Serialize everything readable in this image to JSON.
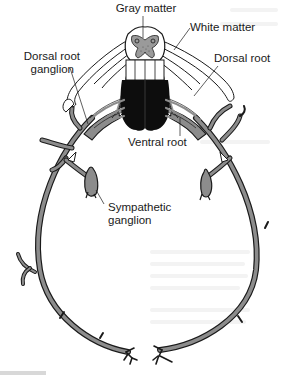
{
  "figure": {
    "type": "anatomical-diagram",
    "colors": {
      "nerve_fill": "#8c8c8c",
      "outline": "#1a1a1a",
      "gray_matter": "#9a9a9a",
      "ventral_mass": "#0d0d0d",
      "white": "#ffffff"
    },
    "labels": {
      "gray_matter": "Gray matter",
      "white_matter": "White matter",
      "dorsal_root_ganglion_line1": "Dorsal root",
      "dorsal_root_ganglion_line2": "ganglion",
      "dorsal_root": "Dorsal root",
      "ventral_root": "Ventral root",
      "sympathetic_ganglion_line1": "Sympathetic",
      "sympathetic_ganglion_line2": "ganglion"
    }
  }
}
